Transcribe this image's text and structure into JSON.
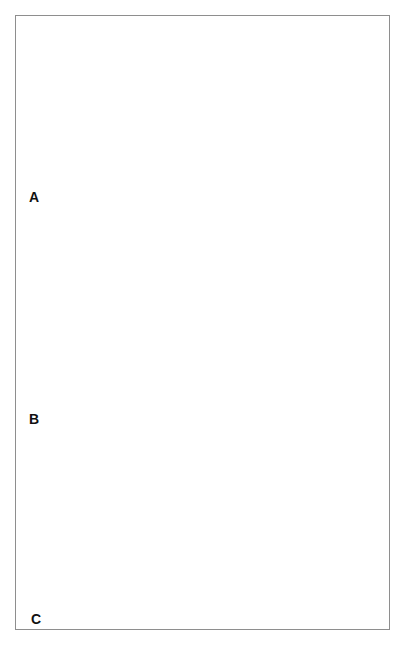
{
  "figure": {
    "style": "grayscale line-and-wash medical illustration",
    "border_color": "#8e8e8e",
    "background_color": "#ffffff",
    "panel_count": 3
  },
  "palette": {
    "page_background": "#ffffff",
    "frame_border": "#8e8e8e",
    "stomach_fill": "#c6c6c6",
    "stomach_fill_light": "#d3d3d3",
    "stomach_highlight": "#e0e0e0",
    "muscle_dark": "#6f6f6f",
    "muscle_mid": "#8a8a8a",
    "muscle_shadow": "#5a5a5a",
    "outline": "#1c1c1c",
    "hatch_line": "#3a3a3a",
    "suture_thread": "#151515",
    "instrument_fill": "#f2f2f2",
    "instrument_shadow": "#b8b8b8",
    "label_text": "#111111"
  },
  "panels": [
    {
      "id": "A",
      "label": "A",
      "caption": "Fundic wrap sutured around the distal esophagus",
      "views": [
        {
          "name": "left-view",
          "description": "Stomach with fundus wrapped posteriorly around the esophagus; multiple untied suture strands held on traction"
        },
        {
          "name": "right-view",
          "description": "Completed wrap with the sutures tied down along the anterior wrap line"
        }
      ]
    },
    {
      "id": "B",
      "label": "B",
      "caption": "Sequential closure of the esophageal hiatus behind the esophagus",
      "views": [
        {
          "name": "step-1",
          "description": "Widened esophageal hiatus with diaphragmatic crura splayed apart, esophagus passing through"
        },
        {
          "name": "step-2",
          "description": "Crural sutures placed, hiatus narrowing around the esophagus"
        },
        {
          "name": "step-3",
          "description": "Crura approximated snugly behind the esophagus, hiatus closed"
        }
      ]
    },
    {
      "id": "C",
      "label": "C",
      "caption": "Anterior gastropexy / seromuscular suture line at the cardia",
      "views": [
        {
          "name": "left-view",
          "description": "Two clamps retract the cardia while untied sutures are held on traction"
        },
        {
          "name": "right-view",
          "description": "Finished interrupted suture line running down the anterior cardia"
        }
      ]
    }
  ]
}
